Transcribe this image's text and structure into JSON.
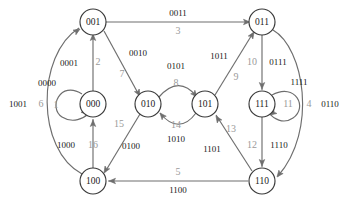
{
  "diagram": {
    "colors": {
      "node_stroke": "#3a3a3a",
      "edge_stroke": "#6e6e6e",
      "input_label": "#1a1a1a",
      "index_label": "#9a9a9a",
      "background": "#ffffff"
    },
    "nodes": [
      {
        "id": "n001",
        "label": "001",
        "cx": 93,
        "cy": 22,
        "r": 13
      },
      {
        "id": "n011",
        "label": "011",
        "cx": 262,
        "cy": 22,
        "r": 13
      },
      {
        "id": "n000",
        "label": "000",
        "cx": 93,
        "cy": 104,
        "r": 13
      },
      {
        "id": "n010",
        "label": "010",
        "cx": 148,
        "cy": 104,
        "r": 13
      },
      {
        "id": "n101",
        "label": "101",
        "cx": 205,
        "cy": 104,
        "r": 13
      },
      {
        "id": "n111",
        "label": "111",
        "cx": 262,
        "cy": 104,
        "r": 13
      },
      {
        "id": "n100",
        "label": "100",
        "cx": 93,
        "cy": 181,
        "r": 13
      },
      {
        "id": "n110",
        "label": "110",
        "cx": 262,
        "cy": 181,
        "r": 13
      }
    ],
    "edges": [
      {
        "from": "001",
        "to": "011",
        "input": "0011",
        "index": "3"
      },
      {
        "from": "000",
        "to": "000",
        "input": "0000",
        "index": "1"
      },
      {
        "from": "000",
        "to": "001",
        "input": "0001",
        "index": "2"
      },
      {
        "from": "001",
        "to": "010",
        "input": "0010",
        "index": "7"
      },
      {
        "from": "010",
        "to": "101",
        "input": "0101",
        "index": "8"
      },
      {
        "from": "101",
        "to": "010",
        "input": "1010",
        "index": "14"
      },
      {
        "from": "101",
        "to": "011",
        "input": "1011",
        "index": "9"
      },
      {
        "from": "011",
        "to": "111",
        "input": "0111",
        "index": "10"
      },
      {
        "from": "111",
        "to": "111",
        "input": "1111",
        "index": "11"
      },
      {
        "from": "111",
        "to": "110",
        "input": "1110",
        "index": "12"
      },
      {
        "from": "011",
        "to": "110",
        "input": "0110",
        "index": "4"
      },
      {
        "from": "110",
        "to": "101",
        "input": "1101",
        "index": "13"
      },
      {
        "from": "110",
        "to": "100",
        "input": "1100",
        "index": "5"
      },
      {
        "from": "100",
        "to": "001",
        "input": "1001",
        "index": "6"
      },
      {
        "from": "100",
        "to": "000",
        "input": "1000",
        "index": "16"
      },
      {
        "from": "010",
        "to": "100",
        "input": "0100",
        "index": "15"
      }
    ],
    "labels": [
      {
        "name": "edge-label-0011",
        "text": "0011",
        "x": 178,
        "y": 13,
        "kind": "input"
      },
      {
        "name": "edge-index-3",
        "text": "3",
        "x": 178,
        "y": 31,
        "kind": "index"
      },
      {
        "name": "edge-label-0000",
        "text": "0000",
        "x": 47,
        "y": 83,
        "kind": "input"
      },
      {
        "name": "edge-index-1",
        "text": "1",
        "x": 56,
        "y": 105,
        "kind": "index"
      },
      {
        "name": "edge-label-0001",
        "text": "0001",
        "x": 69,
        "y": 63,
        "kind": "input"
      },
      {
        "name": "edge-index-2",
        "text": "2",
        "x": 98,
        "y": 62,
        "kind": "index"
      },
      {
        "name": "edge-label-0010",
        "text": "0010",
        "x": 138,
        "y": 53,
        "kind": "input"
      },
      {
        "name": "edge-index-7",
        "text": "7",
        "x": 122,
        "y": 74,
        "kind": "index"
      },
      {
        "name": "edge-label-0101",
        "text": "0101",
        "x": 176,
        "y": 66,
        "kind": "input"
      },
      {
        "name": "edge-index-8",
        "text": "8",
        "x": 176,
        "y": 83,
        "kind": "index"
      },
      {
        "name": "edge-index-14",
        "text": "14",
        "x": 176,
        "y": 125,
        "kind": "index"
      },
      {
        "name": "edge-label-1010",
        "text": "1010",
        "x": 176,
        "y": 139,
        "kind": "input"
      },
      {
        "name": "edge-label-1011",
        "text": "1011",
        "x": 219,
        "y": 56,
        "kind": "input"
      },
      {
        "name": "edge-index-9",
        "text": "9",
        "x": 236,
        "y": 77,
        "kind": "index"
      },
      {
        "name": "edge-index-10",
        "text": "10",
        "x": 252,
        "y": 62,
        "kind": "index"
      },
      {
        "name": "edge-label-0111",
        "text": "0111",
        "x": 278,
        "y": 62,
        "kind": "input"
      },
      {
        "name": "edge-label-1111",
        "text": "1111",
        "x": 299,
        "y": 82,
        "kind": "input"
      },
      {
        "name": "edge-index-11",
        "text": "11",
        "x": 288,
        "y": 104,
        "kind": "index"
      },
      {
        "name": "edge-index-4",
        "text": "4",
        "x": 309,
        "y": 104,
        "kind": "index"
      },
      {
        "name": "edge-label-0110",
        "text": "0110",
        "x": 330,
        "y": 104,
        "kind": "input"
      },
      {
        "name": "edge-index-12",
        "text": "12",
        "x": 252,
        "y": 145,
        "kind": "index"
      },
      {
        "name": "edge-label-1110",
        "text": "1110",
        "x": 279,
        "y": 145,
        "kind": "input"
      },
      {
        "name": "edge-index-13",
        "text": "13",
        "x": 231,
        "y": 129,
        "kind": "index"
      },
      {
        "name": "edge-label-1101",
        "text": "1101",
        "x": 212,
        "y": 149,
        "kind": "input"
      },
      {
        "name": "edge-index-5",
        "text": "5",
        "x": 178,
        "y": 172,
        "kind": "index"
      },
      {
        "name": "edge-label-1100",
        "text": "1100",
        "x": 178,
        "y": 190,
        "kind": "input"
      },
      {
        "name": "edge-label-1001",
        "text": "1001",
        "x": 18,
        "y": 104,
        "kind": "input"
      },
      {
        "name": "edge-index-6",
        "text": "6",
        "x": 41,
        "y": 104,
        "kind": "index"
      },
      {
        "name": "edge-label-1000",
        "text": "1000",
        "x": 66,
        "y": 145,
        "kind": "input"
      },
      {
        "name": "edge-index-16",
        "text": "16",
        "x": 93,
        "y": 145,
        "kind": "index"
      },
      {
        "name": "edge-index-15",
        "text": "15",
        "x": 119,
        "y": 124,
        "kind": "index"
      },
      {
        "name": "edge-label-0100",
        "text": "0100",
        "x": 131,
        "y": 146,
        "kind": "input"
      }
    ],
    "paths": [
      {
        "name": "edge-001-to-011",
        "d": "M 106,22 L 247,22"
      },
      {
        "name": "edge-000-self",
        "d": "M 82,94 C 60,80 48,108 62,117 C 73,124 84,118 88,114"
      },
      {
        "name": "edge-000-to-001",
        "d": "M 93,91 L 93,36"
      },
      {
        "name": "edge-001-to-010",
        "d": "M 104,31 L 139,95"
      },
      {
        "name": "edge-010-to-101",
        "d": "M 159,97 C 172,82 185,82 196,96"
      },
      {
        "name": "edge-101-to-010",
        "d": "M 196,113 C 185,128 172,128 160,113"
      },
      {
        "name": "edge-101-to-011",
        "d": "M 215,95 L 253,33"
      },
      {
        "name": "edge-011-to-111",
        "d": "M 262,35 L 262,90"
      },
      {
        "name": "edge-111-self",
        "d": "M 272,95 C 296,82 308,108 293,118 C 283,125 273,118 270,114"
      },
      {
        "name": "edge-111-to-110",
        "d": "M 262,117 L 262,167"
      },
      {
        "name": "edge-011-to-110",
        "d": "M 273,30 C 304,48 318,130 278,176"
      },
      {
        "name": "edge-110-to-101",
        "d": "M 252,171 L 216,115"
      },
      {
        "name": "edge-110-to-100",
        "d": "M 248,181 L 108,181"
      },
      {
        "name": "edge-100-to-001",
        "d": "M 82,174 C 36,150 36,55 79,28"
      },
      {
        "name": "edge-100-to-000",
        "d": "M 93,168 L 93,119"
      },
      {
        "name": "edge-010-to-100",
        "d": "M 140,114 L 105,172"
      }
    ],
    "arrowheads": [
      {
        "name": "arrow-001-to-011",
        "x": 250,
        "y": 22,
        "angle": 0
      },
      {
        "name": "arrow-000-self",
        "x": 88,
        "y": 114,
        "angle": 35
      },
      {
        "name": "arrow-000-to-001",
        "x": 93,
        "y": 34,
        "angle": -90
      },
      {
        "name": "arrow-001-to-010",
        "x": 140,
        "y": 96,
        "angle": 61
      },
      {
        "name": "arrow-010-to-101",
        "x": 197,
        "y": 97,
        "angle": 50
      },
      {
        "name": "arrow-101-to-010",
        "x": 160,
        "y": 113,
        "angle": -130
      },
      {
        "name": "arrow-101-to-011",
        "x": 254,
        "y": 32,
        "angle": -58
      },
      {
        "name": "arrow-011-to-111",
        "x": 262,
        "y": 89,
        "angle": 90
      },
      {
        "name": "arrow-111-self",
        "x": 270,
        "y": 115,
        "angle": 145
      },
      {
        "name": "arrow-111-to-110",
        "x": 262,
        "y": 166,
        "angle": 90
      },
      {
        "name": "arrow-011-to-110",
        "x": 277,
        "y": 177,
        "angle": 128
      },
      {
        "name": "arrow-110-to-101",
        "x": 216,
        "y": 116,
        "angle": -123
      },
      {
        "name": "arrow-110-to-100",
        "x": 109,
        "y": 181,
        "angle": 180
      },
      {
        "name": "arrow-100-to-001",
        "x": 80,
        "y": 29,
        "angle": -32
      },
      {
        "name": "arrow-100-to-000",
        "x": 93,
        "y": 120,
        "angle": -90
      },
      {
        "name": "arrow-010-to-100",
        "x": 104,
        "y": 173,
        "angle": 121
      }
    ]
  }
}
